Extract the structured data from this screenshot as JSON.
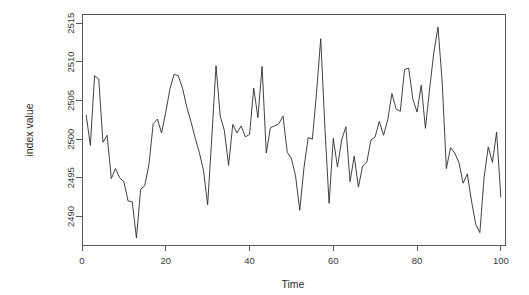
{
  "chart_data": {
    "type": "line",
    "title": "",
    "xlabel": "Time",
    "ylabel": "index value",
    "xlim": [
      0,
      101
    ],
    "ylim": [
      2486.3,
      2516.2
    ],
    "grid": false,
    "legend": null,
    "x_ticks": [
      0,
      20,
      40,
      60,
      80,
      100
    ],
    "x_tick_labels": [
      "0",
      "20",
      "40",
      "60",
      "80",
      "100"
    ],
    "y_ticks": [
      2490,
      2495,
      2500,
      2505,
      2510,
      2515
    ],
    "y_tick_labels": [
      "2490",
      "2495",
      "2500",
      "2505",
      "2510",
      "2515"
    ],
    "series": [
      {
        "name": "index value",
        "color": "#2b2b2b",
        "x": [
          1,
          2,
          3,
          4,
          5,
          6,
          7,
          8,
          9,
          10,
          11,
          12,
          13,
          14,
          15,
          16,
          17,
          18,
          19,
          20,
          21,
          22,
          23,
          24,
          25,
          26,
          27,
          28,
          29,
          30,
          31,
          32,
          33,
          34,
          35,
          36,
          37,
          38,
          39,
          40,
          41,
          42,
          43,
          44,
          45,
          46,
          47,
          48,
          49,
          50,
          51,
          52,
          53,
          54,
          55,
          56,
          57,
          58,
          59,
          60,
          61,
          62,
          63,
          64,
          65,
          66,
          67,
          68,
          69,
          70,
          71,
          72,
          73,
          74,
          75,
          76,
          77,
          78,
          79,
          80,
          81,
          82,
          83,
          84,
          85,
          86,
          87,
          88,
          89,
          90,
          91,
          92,
          93,
          94,
          95,
          96,
          97,
          98,
          99,
          100
        ],
        "y": [
          2503.1,
          2499.2,
          2508.2,
          2507.8,
          2499.6,
          2500.5,
          2494.9,
          2496.2,
          2495.0,
          2494.5,
          2492.0,
          2491.9,
          2487.2,
          2493.5,
          2494.0,
          2496.8,
          2502.0,
          2502.6,
          2500.8,
          2503.5,
          2506.5,
          2508.4,
          2508.2,
          2506.6,
          2504.2,
          2502.3,
          2500.2,
          2498.3,
          2496.0,
          2491.5,
          2500.3,
          2509.5,
          2503.0,
          2501.1,
          2496.6,
          2501.9,
          2500.8,
          2501.7,
          2500.3,
          2500.6,
          2506.6,
          2502.8,
          2509.4,
          2498.2,
          2501.5,
          2501.7,
          2502.0,
          2503.0,
          2498.3,
          2497.5,
          2495.2,
          2490.8,
          2496.3,
          2500.2,
          2500.0,
          2506.0,
          2513.0,
          2501.4,
          2491.7,
          2500.1,
          2496.4,
          2499.9,
          2501.6,
          2494.5,
          2497.8,
          2493.8,
          2496.5,
          2497.0,
          2499.9,
          2500.3,
          2502.3,
          2500.5,
          2502.5,
          2505.9,
          2503.9,
          2503.6,
          2509.0,
          2509.2,
          2505.2,
          2503.5,
          2507.0,
          2501.4,
          2506.5,
          2511.2,
          2514.5,
          2507.4,
          2496.2,
          2498.9,
          2498.2,
          2497.0,
          2494.3,
          2495.5,
          2492.0,
          2489.0,
          2487.9,
          2495.0,
          2499.0,
          2497.0,
          2500.9,
          2492.5
        ]
      }
    ]
  },
  "figure": {
    "background_color": "#ffffff",
    "line_color": "#2b2b2b",
    "axis_color": "#5a5a5a"
  }
}
